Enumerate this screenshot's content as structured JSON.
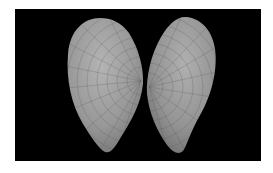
{
  "image": {
    "subject": "Two bivalve shell valves on black background",
    "alt_text": "Pair of bivalve shell valves, left and right, on a black background",
    "background_color": "#000000",
    "border_color": "#ffffff",
    "shell_color": "#9a9a9a",
    "shell_highlight_color": "#b8b8b8",
    "shell_shadow_color": "#6e6e6e"
  }
}
